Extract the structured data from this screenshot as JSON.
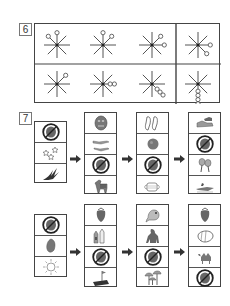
{
  "section6": {
    "number": "6",
    "rows": [
      [
        {
          "circles": [
            {
              "dir": "NW",
              "count": 1
            },
            {
              "dir": "N",
              "count": 1
            }
          ]
        },
        {
          "circles": [
            {
              "dir": "N",
              "count": 1
            },
            {
              "dir": "NE",
              "count": 1
            }
          ]
        },
        {
          "circles": [
            {
              "dir": "NE",
              "count": 1
            },
            {
              "dir": "E",
              "count": 1
            }
          ]
        },
        {
          "circles": [
            {
              "dir": "E",
              "count": 1
            },
            {
              "dir": "SE",
              "count": 1
            }
          ]
        }
      ],
      [
        {
          "circles": [
            {
              "dir": "NE",
              "count": 1
            }
          ]
        },
        {
          "circles": [
            {
              "dir": "E",
              "count": 2
            }
          ]
        },
        {
          "circles": [
            {
              "dir": "SE",
              "count": 3
            }
          ]
        },
        {
          "circles": [
            {
              "dir": "S",
              "count": 4
            }
          ]
        }
      ]
    ]
  },
  "section7": {
    "number": "7",
    "rows": [
      {
        "start": [
          "crossed-out-elephant-icon",
          "stars-icon",
          "swallow-bird-icon"
        ],
        "steps": [
          [
            "mask-icon",
            "crocodiles-icon",
            "crossed-out-book-icon",
            "zebra-icon"
          ],
          [
            "slippers-icon",
            "ball-icon",
            "crossed-out-watermelon-icon",
            "face-mask-icon"
          ],
          [
            "sneakers-icon",
            "crossed-out-cake-icon",
            "maracas-icon",
            "crocodile-icon"
          ]
        ]
      },
      {
        "start": [
          "crossed-out-pineapple-icon",
          "seed-icon",
          "sun-icon"
        ],
        "steps": [
          [
            "strawberry-icon",
            "milk-cartons-icon",
            "crossed-out-roll-icon",
            "flag-field-icon"
          ],
          [
            "frog-icon",
            "gorilla-icon",
            "crossed-out-hedgehog-icon",
            "mushrooms-icon"
          ],
          [
            "strawberry-icon",
            "bread-roll-icon",
            "camel-icon",
            "crossed-out-pencil-icon"
          ]
        ]
      }
    ]
  },
  "colors": {
    "line": "#444444",
    "ray": "#555555",
    "icon": "#666666"
  }
}
